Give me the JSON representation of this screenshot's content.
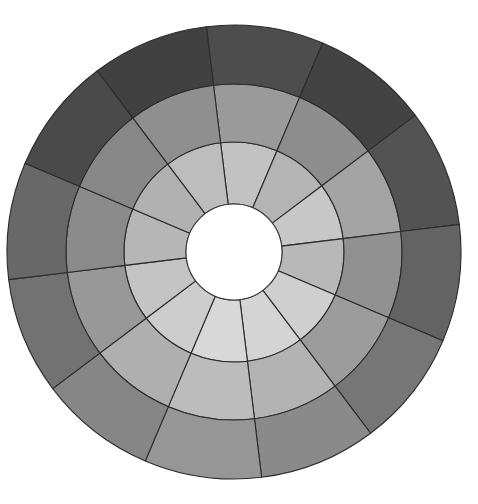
{
  "figure": {
    "background_color": "#ffffff",
    "stroke_color": "#2b2b2b",
    "center_hole_color": "#ffffff"
  },
  "chart_data": {
    "type": "pie",
    "variant": "sunburst-polar-grid",
    "subtitle": "",
    "xlabel": "",
    "ylabel": "",
    "legend_position": "none",
    "grid": false,
    "center": {
      "x": 234,
      "y": 252
    },
    "hole_radius": 48,
    "ring_radii": [
      48,
      110,
      168,
      227
    ],
    "sector_count": 12,
    "ring_count": 3,
    "sector_angle_deg": 30,
    "start_angle_deg": -97,
    "rings": [
      {
        "name": "inner-ring",
        "inner_radius": 48,
        "outer_radius": 110,
        "sectors": [
          {
            "index": 0,
            "angle_start": -97,
            "angle_end": -67,
            "value": 0.78,
            "color": "#c2c2c2"
          },
          {
            "index": 1,
            "angle_start": -67,
            "angle_end": -37,
            "value": 0.72,
            "color": "#b4b4b4"
          },
          {
            "index": 2,
            "angle_start": -37,
            "angle_end": -7,
            "value": 0.8,
            "color": "#c7c7c7"
          },
          {
            "index": 3,
            "angle_start": -7,
            "angle_end": 23,
            "value": 0.74,
            "color": "#b8b8b8"
          },
          {
            "index": 4,
            "angle_start": 23,
            "angle_end": 53,
            "value": 0.84,
            "color": "#cfcfcf"
          },
          {
            "index": 5,
            "angle_start": 53,
            "angle_end": 83,
            "value": 0.86,
            "color": "#d4d4d4"
          },
          {
            "index": 6,
            "angle_start": 83,
            "angle_end": 113,
            "value": 0.88,
            "color": "#d8d8d8"
          },
          {
            "index": 7,
            "angle_start": 113,
            "angle_end": 143,
            "value": 0.83,
            "color": "#cdcdcd"
          },
          {
            "index": 8,
            "angle_start": 143,
            "angle_end": 173,
            "value": 0.79,
            "color": "#c4c4c4"
          },
          {
            "index": 9,
            "angle_start": 173,
            "angle_end": 203,
            "value": 0.73,
            "color": "#b6b6b6"
          },
          {
            "index": 10,
            "angle_start": 203,
            "angle_end": 233,
            "value": 0.71,
            "color": "#b1b1b1"
          },
          {
            "index": 11,
            "angle_start": 233,
            "angle_end": 263,
            "value": 0.76,
            "color": "#bdbdbd"
          }
        ]
      },
      {
        "name": "middle-ring",
        "inner_radius": 110,
        "outer_radius": 168,
        "sectors": [
          {
            "index": 0,
            "angle_start": -97,
            "angle_end": -67,
            "value": 0.62,
            "color": "#9a9a9a"
          },
          {
            "index": 1,
            "angle_start": -67,
            "angle_end": -37,
            "value": 0.56,
            "color": "#8d8d8d"
          },
          {
            "index": 2,
            "angle_start": -37,
            "angle_end": -7,
            "value": 0.66,
            "color": "#a4a4a4"
          },
          {
            "index": 3,
            "angle_start": -7,
            "angle_end": 23,
            "value": 0.58,
            "color": "#919191"
          },
          {
            "index": 4,
            "angle_start": 23,
            "angle_end": 53,
            "value": 0.63,
            "color": "#9c9c9c"
          },
          {
            "index": 5,
            "angle_start": 53,
            "angle_end": 83,
            "value": 0.72,
            "color": "#b3b3b3"
          },
          {
            "index": 6,
            "angle_start": 83,
            "angle_end": 113,
            "value": 0.76,
            "color": "#bcbcbc"
          },
          {
            "index": 7,
            "angle_start": 113,
            "angle_end": 143,
            "value": 0.7,
            "color": "#afafaf"
          },
          {
            "index": 8,
            "angle_start": 143,
            "angle_end": 173,
            "value": 0.61,
            "color": "#989898"
          },
          {
            "index": 9,
            "angle_start": 173,
            "angle_end": 203,
            "value": 0.55,
            "color": "#8b8b8b"
          },
          {
            "index": 10,
            "angle_start": 203,
            "angle_end": 233,
            "value": 0.53,
            "color": "#878787"
          },
          {
            "index": 11,
            "angle_start": 233,
            "angle_end": 263,
            "value": 0.57,
            "color": "#8f8f8f"
          }
        ]
      },
      {
        "name": "outer-ring",
        "inner_radius": 168,
        "outer_radius": 227,
        "sectors": [
          {
            "index": 0,
            "angle_start": -97,
            "angle_end": -67,
            "value": 0.3,
            "color": "#4d4d4d"
          },
          {
            "index": 1,
            "angle_start": -67,
            "angle_end": -37,
            "value": 0.26,
            "color": "#434343"
          },
          {
            "index": 2,
            "angle_start": -37,
            "angle_end": -7,
            "value": 0.33,
            "color": "#535353"
          },
          {
            "index": 3,
            "angle_start": -7,
            "angle_end": 23,
            "value": 0.39,
            "color": "#636363"
          },
          {
            "index": 4,
            "angle_start": 23,
            "angle_end": 53,
            "value": 0.47,
            "color": "#767676"
          },
          {
            "index": 5,
            "angle_start": 53,
            "angle_end": 83,
            "value": 0.55,
            "color": "#8a8a8a"
          },
          {
            "index": 6,
            "angle_start": 83,
            "angle_end": 113,
            "value": 0.6,
            "color": "#969696"
          },
          {
            "index": 7,
            "angle_start": 113,
            "angle_end": 143,
            "value": 0.53,
            "color": "#868686"
          },
          {
            "index": 8,
            "angle_start": 143,
            "angle_end": 173,
            "value": 0.45,
            "color": "#727272"
          },
          {
            "index": 9,
            "angle_start": 173,
            "angle_end": 203,
            "value": 0.41,
            "color": "#686868"
          },
          {
            "index": 10,
            "angle_start": 203,
            "angle_end": 233,
            "value": 0.29,
            "color": "#4a4a4a"
          },
          {
            "index": 11,
            "angle_start": 233,
            "angle_end": 263,
            "value": 0.25,
            "color": "#414141"
          }
        ]
      }
    ]
  }
}
